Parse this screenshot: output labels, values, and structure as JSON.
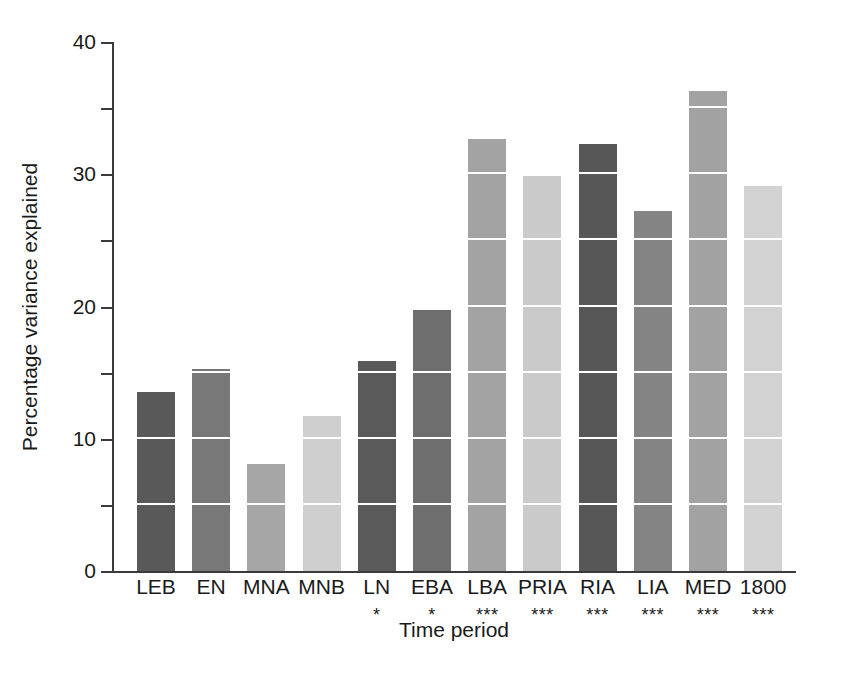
{
  "chart_data": {
    "type": "bar",
    "title": "",
    "xlabel": "Time period",
    "ylabel": "Percentage variance explained",
    "categories": [
      "LEB",
      "EN",
      "MNA",
      "MNB",
      "LN",
      "EBA",
      "LBA",
      "PRIA",
      "RIA",
      "LIA",
      "MED",
      "1800"
    ],
    "values": [
      13.5,
      15.3,
      8.1,
      11.7,
      15.9,
      19.7,
      32.7,
      29.9,
      32.3,
      27.2,
      36.3,
      29.1
    ],
    "significance": [
      "",
      "",
      "",
      "",
      "*",
      "*",
      "***",
      "***",
      "***",
      "***",
      "***",
      "***"
    ],
    "bar_colors": [
      "#595959",
      "#787878",
      "#a6a6a6",
      "#cfcfcf",
      "#5a5a5a",
      "#6e6e6e",
      "#a3a3a3",
      "#cacaca",
      "#575757",
      "#848484",
      "#a2a2a2",
      "#d2d2d2"
    ],
    "ylim": [
      0,
      40
    ],
    "ytick_major": [
      0,
      10,
      20,
      30,
      40
    ],
    "ytick_minor": [
      5,
      15,
      25,
      35
    ],
    "ytick_labels": [
      "0",
      "10",
      "20",
      "30",
      "40"
    ],
    "gridlines_in_bars": [
      5,
      10,
      15,
      20,
      25,
      30,
      35
    ],
    "grid": "white horizontal lines drawn inside bars every 5 units",
    "legend": "none",
    "axis_color": "#3a3a3a",
    "background_color": "#ffffff"
  },
  "axes": {
    "y_title": "Percentage variance explained",
    "x_title": "Time period"
  }
}
